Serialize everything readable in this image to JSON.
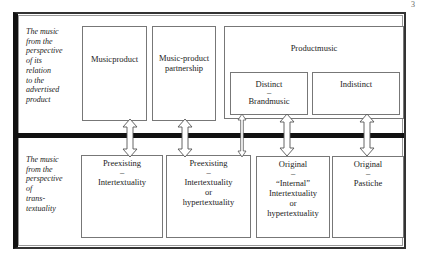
{
  "page_number": "3",
  "rows": {
    "top": {
      "label_lines": [
        "The music",
        "from the",
        "perspective",
        "of its",
        "relation",
        "to the",
        "advertised",
        "product"
      ]
    },
    "bottom": {
      "label_lines": [
        "The music",
        "from the",
        "perspective",
        "of",
        "trans-",
        "textuality"
      ]
    }
  },
  "top_boxes": {
    "musicproduct": {
      "label": "Musicproduct"
    },
    "partnership": {
      "label_lines": [
        "Music-product",
        "partnership"
      ]
    },
    "productmusic": {
      "label": "Productmusic",
      "distinct": {
        "line1": "Distinct",
        "dash": "–",
        "line2": "Brandmusic"
      },
      "indistinct": {
        "label": "Indistinct"
      }
    }
  },
  "bottom_boxes": [
    {
      "line1": "Preexisting",
      "dash": "–",
      "rest": [
        "Intertextuality"
      ]
    },
    {
      "line1": "Preexisting",
      "dash": "–",
      "rest": [
        "Intertextuality",
        "or",
        "hypertextuality"
      ]
    },
    {
      "line1": "Original",
      "dash": "–",
      "rest": [
        "“Internal”",
        "Intertextuality",
        "or",
        "hypertextuality"
      ]
    },
    {
      "line1": "Original",
      "dash": "–",
      "rest": [
        "Pastiche"
      ]
    }
  ],
  "arrows": [
    {
      "from": "Musicproduct",
      "to": "Preexisting – Intertextuality",
      "type": "double-headed wide"
    },
    {
      "from": "Music-product partnership",
      "to": "Preexisting – Intertextuality or hypertextuality",
      "type": "double-headed wide"
    },
    {
      "from": "Distinct – Brandmusic",
      "to": "Preexisting – Intertextuality or hypertextuality",
      "type": "double-headed thin"
    },
    {
      "from": "Distinct – Brandmusic",
      "to": "Original – “Internal” Intertextuality or hypertextuality",
      "type": "double-headed wide"
    },
    {
      "from": "Indistinct",
      "to": "Original – Pastiche",
      "type": "double-headed wide"
    }
  ]
}
